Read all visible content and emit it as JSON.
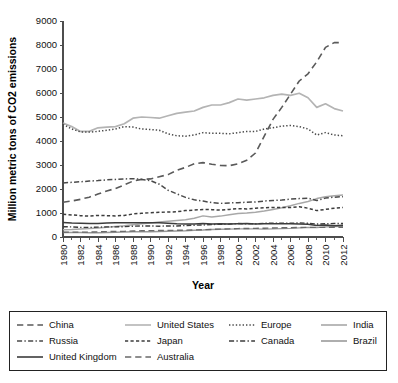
{
  "chart_data": {
    "type": "line",
    "title": "",
    "xlabel": "Year",
    "ylabel": "Million metric tons of CO2 emissions",
    "xlim": [
      1980,
      2012
    ],
    "ylim": [
      0,
      9000
    ],
    "ytick_step": 1000,
    "xtick_step": 2,
    "minor_xticks": true,
    "grid": false,
    "legend_position": "bottom",
    "legend_columns": 4,
    "x": [
      1980,
      1981,
      1982,
      1983,
      1984,
      1985,
      1986,
      1987,
      1988,
      1989,
      1990,
      1991,
      1992,
      1993,
      1994,
      1995,
      1996,
      1997,
      1998,
      1999,
      2000,
      2001,
      2002,
      2003,
      2004,
      2005,
      2006,
      2007,
      2008,
      2009,
      2010,
      2011,
      2012
    ],
    "ytick_labels": [
      "0",
      "1000",
      "2000",
      "3000",
      "4000",
      "5000",
      "6000",
      "7000",
      "8000",
      "9000"
    ],
    "xtick_labels": [
      "1980",
      "1982",
      "1984",
      "1986",
      "1988",
      "1990",
      "1992",
      "1994",
      "1996",
      "1998",
      "2000",
      "2002",
      "2004",
      "2006",
      "2008",
      "2010",
      "2012"
    ],
    "series": [
      {
        "name": "China",
        "dash": "long-dash",
        "color": "#5a5a5a",
        "width": 1.6,
        "values": [
          1450,
          1500,
          1570,
          1660,
          1790,
          1920,
          2020,
          2170,
          2330,
          2400,
          2420,
          2510,
          2600,
          2780,
          2900,
          3050,
          3100,
          3030,
          2980,
          2970,
          3050,
          3200,
          3500,
          4200,
          4900,
          5400,
          5950,
          6500,
          6800,
          7300,
          7900,
          8100,
          8100
        ]
      },
      {
        "name": "United States",
        "dash": "solid",
        "color": "#b4b4b4",
        "width": 1.7,
        "values": [
          4750,
          4600,
          4400,
          4400,
          4550,
          4580,
          4600,
          4720,
          4950,
          5000,
          4980,
          4950,
          5050,
          5150,
          5200,
          5250,
          5400,
          5500,
          5500,
          5600,
          5750,
          5700,
          5750,
          5800,
          5900,
          5950,
          5900,
          5990,
          5800,
          5400,
          5550,
          5350,
          5250
        ]
      },
      {
        "name": "Europe",
        "dash": "dotted",
        "color": "#4a4a4a",
        "width": 1.5,
        "values": [
          4700,
          4500,
          4380,
          4370,
          4400,
          4450,
          4500,
          4600,
          4580,
          4500,
          4480,
          4450,
          4300,
          4220,
          4200,
          4250,
          4350,
          4320,
          4320,
          4300,
          4350,
          4400,
          4400,
          4500,
          4550,
          4620,
          4650,
          4600,
          4500,
          4250,
          4350,
          4250,
          4220
        ]
      },
      {
        "name": "India",
        "dash": "solid",
        "color": "#a8a8a8",
        "width": 1.5,
        "values": [
          300,
          310,
          330,
          350,
          380,
          410,
          440,
          470,
          510,
          550,
          580,
          620,
          660,
          690,
          720,
          780,
          880,
          830,
          870,
          930,
          980,
          1000,
          1030,
          1080,
          1150,
          1220,
          1300,
          1400,
          1480,
          1600,
          1680,
          1720,
          1750
        ]
      },
      {
        "name": "Russia",
        "dash": "dash-dot",
        "color": "#4a4a4a",
        "width": 1.5,
        "values": [
          2250,
          2280,
          2300,
          2330,
          2350,
          2380,
          2400,
          2420,
          2430,
          2400,
          2350,
          2200,
          1950,
          1800,
          1650,
          1550,
          1500,
          1430,
          1400,
          1420,
          1430,
          1450,
          1460,
          1500,
          1520,
          1540,
          1580,
          1600,
          1620,
          1520,
          1620,
          1660,
          1680
        ]
      },
      {
        "name": "Japan",
        "dash": "short-dash",
        "color": "#3c3c3c",
        "width": 1.5,
        "values": [
          950,
          920,
          890,
          870,
          900,
          890,
          880,
          900,
          960,
          990,
          1010,
          1030,
          1040,
          1050,
          1100,
          1120,
          1150,
          1140,
          1120,
          1150,
          1180,
          1170,
          1200,
          1220,
          1230,
          1230,
          1230,
          1260,
          1200,
          1100,
          1150,
          1200,
          1230
        ]
      },
      {
        "name": "Canada",
        "dash": "dash-dot",
        "color": "#3c3c3c",
        "width": 1.4,
        "values": [
          430,
          420,
          400,
          400,
          410,
          420,
          420,
          430,
          450,
          460,
          460,
          450,
          460,
          460,
          480,
          490,
          500,
          520,
          530,
          540,
          560,
          550,
          550,
          570,
          580,
          580,
          570,
          590,
          570,
          540,
          550,
          560,
          560
        ]
      },
      {
        "name": "Brazil",
        "dash": "solid",
        "color": "#9a9a9a",
        "width": 1.4,
        "values": [
          190,
          190,
          190,
          180,
          180,
          190,
          200,
          210,
          220,
          220,
          220,
          230,
          240,
          250,
          260,
          280,
          290,
          310,
          320,
          330,
          340,
          340,
          340,
          330,
          340,
          350,
          360,
          380,
          400,
          390,
          420,
          440,
          450
        ]
      },
      {
        "name": "United Kingdom",
        "dash": "solid",
        "color": "#3c3c3c",
        "width": 1.5,
        "values": [
          600,
          580,
          570,
          560,
          560,
          580,
          590,
          590,
          590,
          590,
          590,
          590,
          570,
          550,
          540,
          540,
          560,
          540,
          550,
          540,
          550,
          560,
          540,
          550,
          550,
          550,
          550,
          540,
          530,
          480,
          500,
          470,
          490
        ]
      },
      {
        "name": "Australia",
        "dash": "long-dash",
        "color": "#6a6a6a",
        "width": 1.4,
        "values": [
          200,
          205,
          205,
          205,
          215,
          225,
          230,
          235,
          250,
          260,
          265,
          270,
          275,
          280,
          285,
          295,
          305,
          315,
          330,
          340,
          350,
          355,
          360,
          365,
          375,
          385,
          390,
          395,
          400,
          400,
          400,
          405,
          405
        ]
      }
    ]
  },
  "legend": {
    "items": [
      {
        "label": "China",
        "style": "long-dash",
        "color": "#5a5a5a"
      },
      {
        "label": "United States",
        "style": "solid",
        "color": "#b4b4b4"
      },
      {
        "label": "Europe",
        "style": "dotted",
        "color": "#4a4a4a"
      },
      {
        "label": "India",
        "style": "solid",
        "color": "#a8a8a8"
      },
      {
        "label": "Russia",
        "style": "dash-dot",
        "color": "#4a4a4a"
      },
      {
        "label": "Japan",
        "style": "short-dash",
        "color": "#3c3c3c"
      },
      {
        "label": "Canada",
        "style": "dash-dot",
        "color": "#3c3c3c"
      },
      {
        "label": "Brazil",
        "style": "solid",
        "color": "#9a9a9a"
      },
      {
        "label": "United Kingdom",
        "style": "solid",
        "color": "#3c3c3c"
      },
      {
        "label": "Australia",
        "style": "long-dash",
        "color": "#6a6a6a"
      }
    ]
  }
}
